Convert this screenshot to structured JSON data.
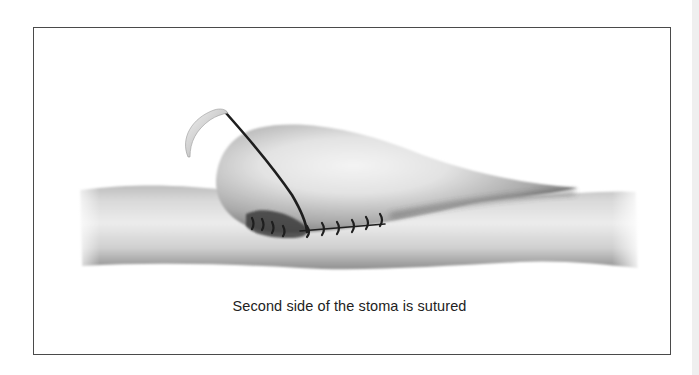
{
  "figure": {
    "caption": "Second side of the stoma is sutured",
    "colors": {
      "frame_border": "#4a4a4a",
      "background": "#ffffff",
      "tissue_light": "#e4e4e4",
      "tissue_mid": "#b0b0b0",
      "tissue_dark": "#5a5a5a",
      "suture": "#1e1e1e",
      "needle": "#cfcfcf",
      "right_strip": "#efefef"
    },
    "elements": {
      "bowel": "bowel-segment",
      "stoma": "stoma-bulb",
      "needle": "curved-surgical-needle",
      "thread": "suture-thread",
      "stitches": "interrupted-suture-line"
    }
  }
}
